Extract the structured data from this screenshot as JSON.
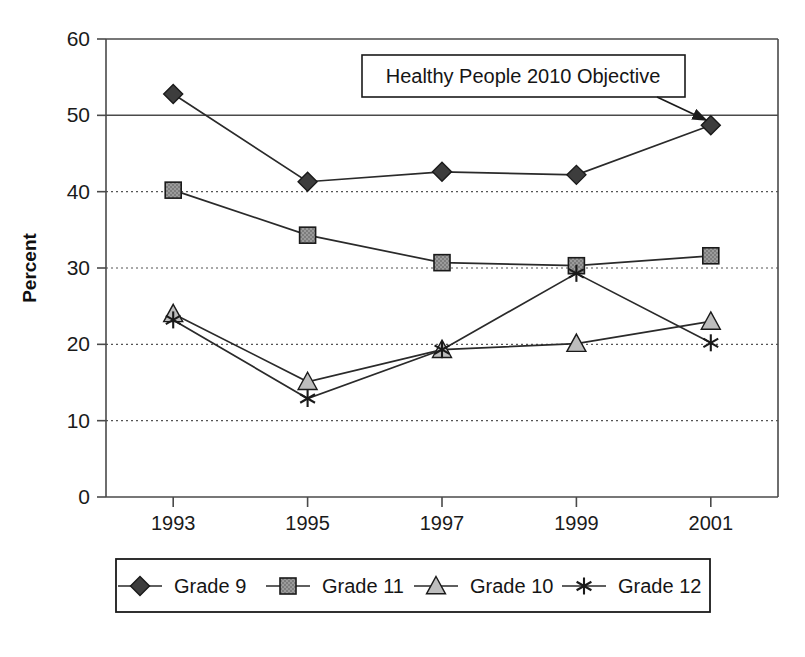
{
  "chart_data": {
    "type": "line",
    "title": "",
    "xlabel": "",
    "ylabel": "Percent",
    "categories": [
      "1993",
      "1995",
      "1997",
      "1999",
      "2001"
    ],
    "ylim": [
      0,
      60
    ],
    "ytick_values": [
      0,
      10,
      20,
      30,
      40,
      50,
      60
    ],
    "ytick_labels": [
      "0",
      "10",
      "20",
      "30",
      "40",
      "50",
      "60"
    ],
    "grid": "horizontal dotted gridlines at 10,20,30,40; solid lines at 50 and 60",
    "legend_position": "below plot, single row inside bordered box",
    "series": [
      {
        "name": "Grade 9",
        "marker": "diamond",
        "marker_color": "#3d3d3d",
        "values": [
          52.8,
          41.3,
          42.6,
          42.2,
          48.7
        ]
      },
      {
        "name": "Grade 11",
        "marker": "square",
        "marker_color": "#8a8a8a",
        "values": [
          40.2,
          34.3,
          30.7,
          30.3,
          31.6
        ]
      },
      {
        "name": "Grade 10",
        "marker": "triangle",
        "marker_color": "#bdbdbd",
        "values": [
          24.0,
          15.1,
          19.3,
          20.1,
          23.0
        ]
      },
      {
        "name": "Grade 12",
        "marker": "asterisk",
        "marker_color": "#1a1a1a",
        "values": [
          23.2,
          12.9,
          19.3,
          29.3,
          20.2
        ]
      }
    ],
    "annotations": [
      {
        "text": "Healthy People 2010 Objective",
        "style": "boxed label with arrow",
        "points_to": "objective line at 50 percent near 2001"
      }
    ],
    "reference_line": {
      "value": 50,
      "label": "Healthy People 2010 Objective"
    }
  },
  "legend": {
    "entries": [
      {
        "label": "Grade 9"
      },
      {
        "label": "Grade 11"
      },
      {
        "label": "Grade 10"
      },
      {
        "label": "Grade 12"
      }
    ]
  },
  "annotation": {
    "label": "Healthy People 2010 Objective"
  },
  "axis": {
    "y_title": "Percent"
  },
  "caption": {
    "text": ""
  }
}
